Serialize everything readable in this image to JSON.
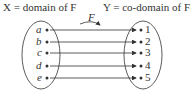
{
  "title_left": "X = domain of F",
  "title_right": "Y = co-domain of F",
  "function_label": "F",
  "domain": [
    "a",
    "b",
    "c",
    "d",
    "e"
  ],
  "codomain": [
    "1",
    "2",
    "3",
    "4",
    "5"
  ],
  "mapping": [
    [
      "a",
      "1"
    ],
    [
      "b",
      "2"
    ],
    [
      "c",
      "3"
    ],
    [
      "d",
      "4"
    ],
    [
      "e",
      "5"
    ]
  ]
}
